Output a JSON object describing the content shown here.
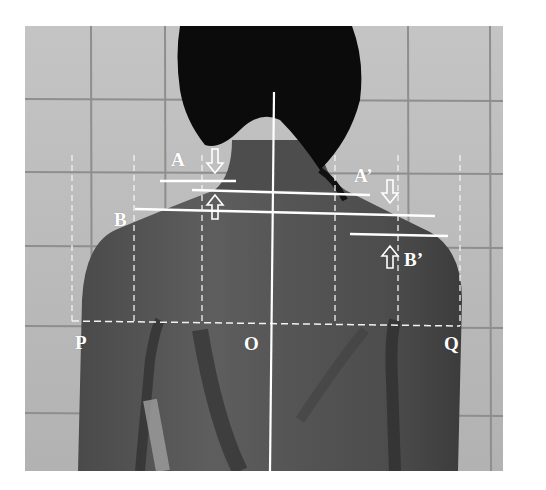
{
  "figure": {
    "labels": {
      "A": "A",
      "A_prime": "A’",
      "B": "B",
      "B_prime": "B’",
      "P": "P",
      "O": "O",
      "Q": "Q"
    },
    "colors": {
      "annotation": "#ffffff",
      "tile": "#bdbdbd",
      "grout": "#8f8f8f",
      "skin": "#5a5a5a",
      "hair": "#0a0a0a"
    }
  }
}
